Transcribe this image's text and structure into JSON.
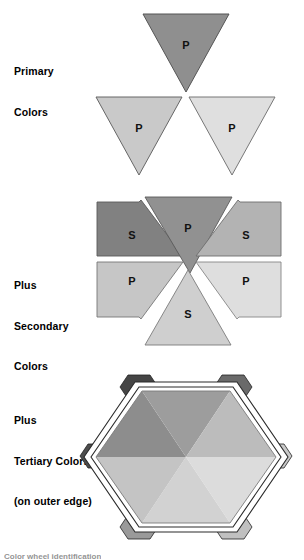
{
  "figure": {
    "background": "#ffffff"
  },
  "sections": [
    {
      "id": "primary",
      "label_lines": [
        "Primary",
        "Colors"
      ],
      "shape": "three separated downward triangles",
      "triangles": [
        {
          "position": "top",
          "letter": "P",
          "fill": "#8f8f8f",
          "stroke": "#555555"
        },
        {
          "position": "bottom-left",
          "letter": "P",
          "fill": "#c9c9c9",
          "stroke": "#666666"
        },
        {
          "position": "bottom-right",
          "letter": "P",
          "fill": "#dfdfdf",
          "stroke": "#777777"
        }
      ]
    },
    {
      "id": "secondary",
      "label_lines": [
        "Plus",
        "Secondary",
        "Colors"
      ],
      "shape": "hexagon split into six wedges with white gaps",
      "triangles": [
        {
          "position": "top-left",
          "letter": "S",
          "fill": "#818181",
          "stroke": "#5a5a5a"
        },
        {
          "position": "top-center",
          "letter": "P",
          "fill": "#919191",
          "stroke": "#5a5a5a"
        },
        {
          "position": "top-right",
          "letter": "S",
          "fill": "#b3b3b3",
          "stroke": "#6e6e6e"
        },
        {
          "position": "bottom-left",
          "letter": "P",
          "fill": "#c6c6c6",
          "stroke": "#777777"
        },
        {
          "position": "bottom-center",
          "letter": "S",
          "fill": "#cfcfcf",
          "stroke": "#7c7c7c"
        },
        {
          "position": "bottom-right",
          "letter": "P",
          "fill": "#dedede",
          "stroke": "#878787"
        }
      ]
    },
    {
      "id": "tertiary",
      "label_lines": [
        "Plus",
        "Tertiary Colors",
        "(on outer edge)"
      ],
      "shape": "solid hexagon of six wedges inside a double-line hexagon ring with six tertiary tabs at the vertices",
      "wedges": [
        {
          "position": "top-left",
          "fill": "#8d8d8d"
        },
        {
          "position": "top-center",
          "fill": "#9d9d9d"
        },
        {
          "position": "top-right",
          "fill": "#bcbcbc"
        },
        {
          "position": "bottom-right",
          "fill": "#dcdcdc"
        },
        {
          "position": "bottom-center",
          "fill": "#d2d2d2"
        },
        {
          "position": "bottom-left",
          "fill": "#c4c4c4"
        }
      ],
      "tertiary_tabs": [
        {
          "position": "top-left",
          "fill": "#454545"
        },
        {
          "position": "top-right",
          "fill": "#6a6a6a"
        },
        {
          "position": "right",
          "fill": "#c9c9c9"
        },
        {
          "position": "bottom-right",
          "fill": "#c0c0c0"
        },
        {
          "position": "bottom-left",
          "fill": "#9a9a9a"
        },
        {
          "position": "left",
          "fill": "#4d4d4d"
        }
      ],
      "ring": {
        "stroke": "#2b2b2b",
        "fill": "#ffffff"
      }
    }
  ],
  "footer": {
    "text": "Color wheel identification"
  }
}
